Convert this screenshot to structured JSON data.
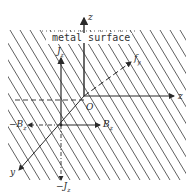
{
  "diagram": {
    "surface_label": "metal surface",
    "origin_label": "O",
    "axes": {
      "vertical_axis_label": "z",
      "horizontal_axis_label": "z",
      "diagonal_axis_label": "y"
    },
    "vectors": {
      "jz_label": "J",
      "jz_sub": "z",
      "neg_jz_label": "−J",
      "neg_jz_sub": "z",
      "bz_label": "B",
      "bz_sub": "z",
      "neg_bz_label": "−B",
      "neg_bz_sub": "z",
      "fy_label": "f",
      "fy_sub": "y"
    },
    "colors": {
      "line": "#2a2a2a",
      "hatch": "#3a3a3a",
      "background": "#ffffff"
    }
  }
}
